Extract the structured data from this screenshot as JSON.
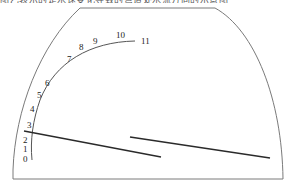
{
  "header": {
    "text": "图乙表示的是水速变化导致的弯道处水流方向的示意图"
  },
  "diagram": {
    "type": "channel-cross-section",
    "tick_labels": [
      "0",
      "1",
      "2",
      "3",
      "4",
      "5",
      "6",
      "7",
      "8",
      "9",
      "10",
      "11"
    ],
    "colors": {
      "outline": "#7a7a7a",
      "arc": "#555555",
      "line": "#2a2a2a"
    }
  }
}
